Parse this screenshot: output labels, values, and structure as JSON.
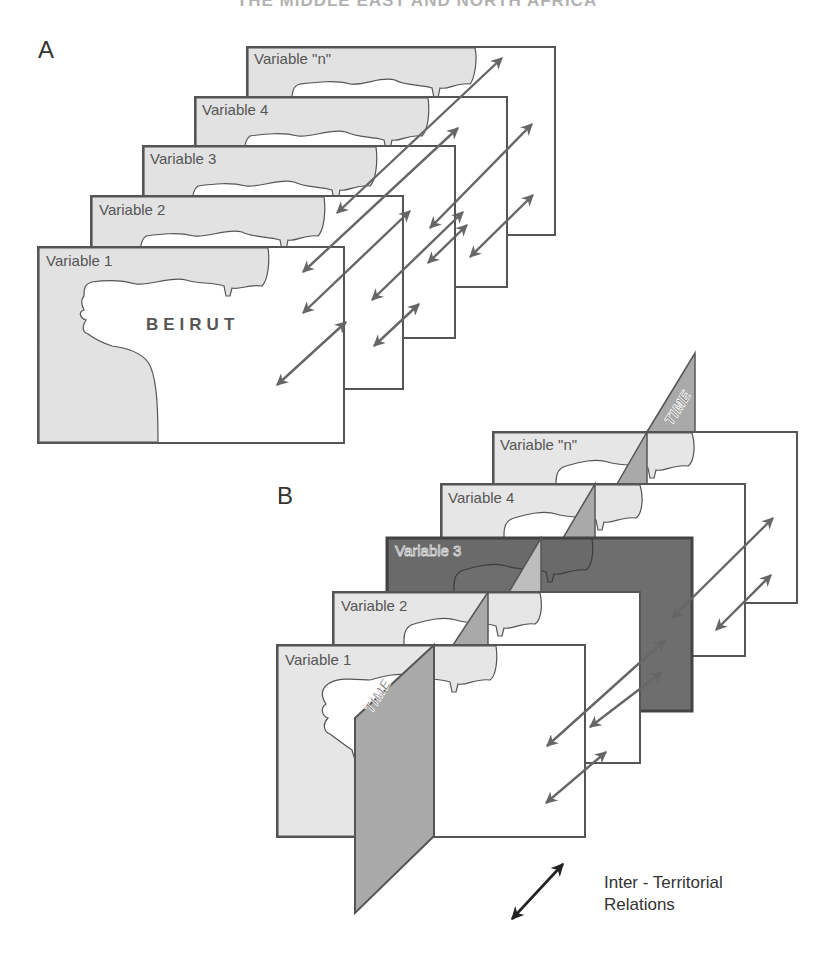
{
  "header": {
    "title_partial": "THE MIDDLE EAST AND NORTH AFRICA"
  },
  "panel_a": {
    "label": "A",
    "city_label": "BEIRUT",
    "layers": [
      {
        "label": "Variable \"n\""
      },
      {
        "label": "Variable 4"
      },
      {
        "label": "Variable 3"
      },
      {
        "label": "Variable 2"
      },
      {
        "label": "Variable 1"
      }
    ]
  },
  "panel_b": {
    "label": "B",
    "time_label_top": "TIME",
    "time_label_bottom": "TIME",
    "highlighted_layer": "Variable 3",
    "layers": [
      {
        "label": "Variable \"n\""
      },
      {
        "label": "Variable 4"
      },
      {
        "label": "Variable 3"
      },
      {
        "label": "Variable 2"
      },
      {
        "label": "Variable 1"
      }
    ]
  },
  "legend": {
    "icon": "double-arrow-icon",
    "line1": "Inter - Territorial",
    "line2": "Relations"
  },
  "colors": {
    "outline": "#555555",
    "land": "#e2e2e2",
    "highlight_layer": "#6e6e6e",
    "time_plane": "#a9a9a9",
    "arrow": "#666666",
    "legend_arrow": "#222222"
  }
}
